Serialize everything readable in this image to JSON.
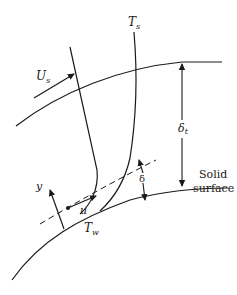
{
  "diagram": {
    "type": "boundary-layer schematic",
    "colors": {
      "line": "#1a1a1a",
      "background": "#ffffff"
    },
    "labels": {
      "free_stream_velocity": {
        "main": "U",
        "sub": "s"
      },
      "free_stream_temperature": {
        "main": "T",
        "sub": "s"
      },
      "wall_temperature": {
        "main": "T",
        "sub": "w"
      },
      "thermal_thickness": {
        "main": "δ",
        "sub": "t"
      },
      "velocity_thickness": "δ",
      "velocity": "u",
      "normal_coordinate": "y",
      "surface_line1": "Solid",
      "surface_line2": "surface"
    }
  }
}
